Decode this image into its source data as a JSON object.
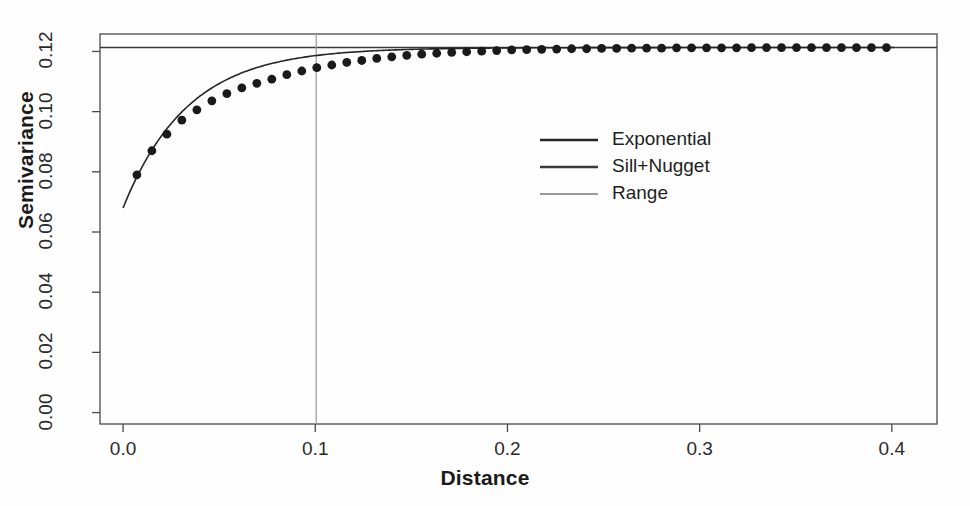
{
  "chart_data": {
    "type": "scatter",
    "title": "",
    "xlabel": "Distance",
    "ylabel": "Semivariance",
    "xlim": [
      -0.012,
      0.4235
    ],
    "ylim": [
      -0.0038,
      0.1258
    ],
    "xticks": [
      0.0,
      0.1,
      0.2,
      0.3,
      0.4
    ],
    "xtick_labels": [
      "0.0",
      "0.1",
      "0.2",
      "0.3",
      "0.4"
    ],
    "yticks": [
      0.0,
      0.02,
      0.04,
      0.06,
      0.08,
      0.1,
      0.12
    ],
    "ytick_labels": [
      "0.00",
      "0.02",
      "0.04",
      "0.06",
      "0.08",
      "0.10",
      "0.12"
    ],
    "grid": false,
    "legend_position": "center",
    "model": {
      "name": "Exponential",
      "nugget": 0.068,
      "sill_plus_nugget": 0.1213,
      "partial_sill": 0.0533,
      "range": 0.1005,
      "practical_range_parameter": 0.0335
    },
    "series": [
      {
        "name": "Empirical semivariogram",
        "marker": "filled-circle",
        "color": "#1a1a1a",
        "x": [
          0.0072,
          0.015,
          0.0228,
          0.0306,
          0.0384,
          0.0462,
          0.054,
          0.0618,
          0.0696,
          0.0774,
          0.0852,
          0.093,
          0.1008,
          0.1086,
          0.1164,
          0.1242,
          0.132,
          0.1398,
          0.1476,
          0.1554,
          0.1632,
          0.171,
          0.1788,
          0.1866,
          0.1944,
          0.2022,
          0.21,
          0.2178,
          0.2256,
          0.2334,
          0.2412,
          0.249,
          0.2568,
          0.2646,
          0.2724,
          0.2802,
          0.288,
          0.2958,
          0.3036,
          0.3114,
          0.3192,
          0.327,
          0.3348,
          0.3426,
          0.3504,
          0.3582,
          0.366,
          0.3738,
          0.3816,
          0.3894,
          0.3972
        ],
        "y": [
          0.079,
          0.087,
          0.0925,
          0.0972,
          0.1006,
          0.1036,
          0.106,
          0.1079,
          0.1094,
          0.1108,
          0.1123,
          0.1135,
          0.1146,
          0.1155,
          0.1164,
          0.117,
          0.1177,
          0.1182,
          0.1187,
          0.1191,
          0.1194,
          0.1197,
          0.1199,
          0.1201,
          0.1203,
          0.1205,
          0.1206,
          0.1207,
          0.1208,
          0.1209,
          0.1209,
          0.121,
          0.121,
          0.1211,
          0.1211,
          0.1211,
          0.1212,
          0.1212,
          0.1212,
          0.1212,
          0.1212,
          0.1213,
          0.1213,
          0.1213,
          0.1213,
          0.1213,
          0.1213,
          0.1213,
          0.1213,
          0.1213,
          0.1213
        ]
      }
    ],
    "lines": [
      {
        "name": "Exponential",
        "kind": "model-curve",
        "color": "#262626",
        "width": 1.6
      },
      {
        "name": "Sill+Nugget",
        "kind": "horizontal",
        "value": 0.1213,
        "color": "#3a3a3a",
        "width": 1.4
      },
      {
        "name": "Range",
        "kind": "vertical",
        "value": 0.1005,
        "color": "#9a9a9a",
        "width": 1.2
      }
    ],
    "legend": [
      {
        "label": "Exponential",
        "color": "#262626",
        "width": 2.4
      },
      {
        "label": "Sill+Nugget",
        "color": "#3a3a3a",
        "width": 2.4
      },
      {
        "label": "Range",
        "color": "#9a9a9a",
        "width": 1.8
      }
    ]
  }
}
